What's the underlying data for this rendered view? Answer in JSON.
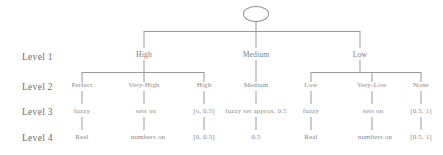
{
  "diagram": {
    "type": "hierarchical-tree",
    "title": "",
    "root": {
      "shape": "ellipse",
      "label": ""
    },
    "row_labels": [
      {
        "name": "level-1",
        "label": "Level 1"
      },
      {
        "name": "level-2",
        "label": "Level 2"
      },
      {
        "name": "level-3",
        "label": "Level 3"
      },
      {
        "name": "level-4",
        "label": "Level 4"
      }
    ],
    "levels": {
      "level1": [
        {
          "label": "High"
        },
        {
          "label": "Medium"
        },
        {
          "label": "Low"
        }
      ],
      "level2": [
        {
          "label": "Perfect"
        },
        {
          "label": "Very-High"
        },
        {
          "label": "High"
        },
        {
          "label": "Medium"
        },
        {
          "label": "Low"
        },
        {
          "label": "Very-Low"
        },
        {
          "label": "None"
        }
      ],
      "level3": [
        {
          "label": "fuzzy"
        },
        {
          "label": "sets  on"
        },
        {
          "label": "[o, 0.5]"
        },
        {
          "label": "fuzzy set approx. 0.5"
        },
        {
          "label": "fuzzy"
        },
        {
          "label": "sets on"
        },
        {
          "label": "[0.5, 1]"
        }
      ],
      "level4": [
        {
          "label": "Real"
        },
        {
          "label": "numbers   on"
        },
        {
          "label": "[0, 0.5]"
        },
        {
          "label": "0.5"
        },
        {
          "label": "Real"
        },
        {
          "label": "numbers   on"
        },
        {
          "label": "[0.5, 1]"
        }
      ]
    },
    "colors": {
      "background": "#ffffff",
      "line": "#9a9a9a",
      "text": "#8a8a8a",
      "row_label_text": "#6e6e6e"
    }
  }
}
